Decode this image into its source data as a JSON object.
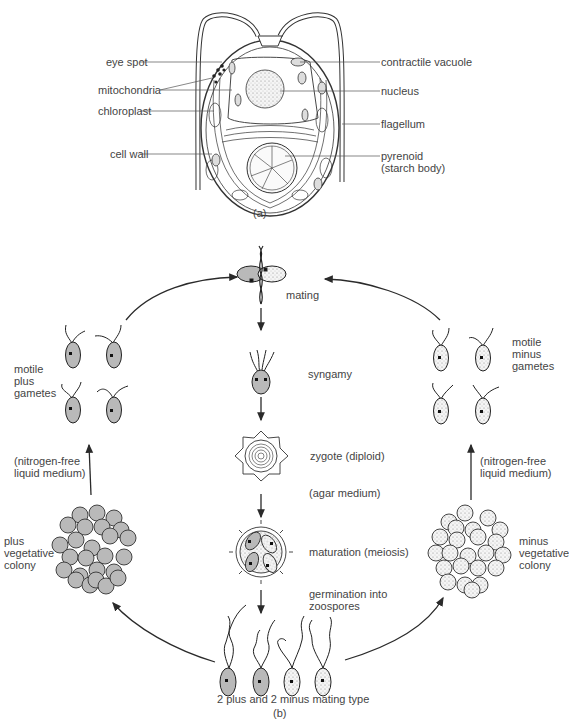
{
  "figure_a": {
    "caption": "(a)",
    "title": "Chlamydomonas cell structure",
    "labels_left": [
      {
        "id": "eye-spot",
        "text": "eye spot"
      },
      {
        "id": "mitochondria",
        "text": "mitochondria"
      },
      {
        "id": "chloroplast",
        "text": "chloroplast"
      },
      {
        "id": "cell-wall",
        "text": "cell wall"
      }
    ],
    "labels_right": [
      {
        "id": "contractile-vacuole",
        "text": "contractile vacuole"
      },
      {
        "id": "nucleus",
        "text": "nucleus"
      },
      {
        "id": "flagellum",
        "text": "flagellum"
      },
      {
        "id": "pyrenoid",
        "text": "pyrenoid\n(starch body)"
      }
    ]
  },
  "figure_b": {
    "caption": "(b)",
    "center_stages": [
      {
        "id": "mating",
        "text": "mating"
      },
      {
        "id": "syngamy",
        "text": "syngamy"
      },
      {
        "id": "zygote",
        "text": "zygote (diploid)"
      },
      {
        "id": "agar",
        "text": "(agar medium)"
      },
      {
        "id": "maturation",
        "text": "maturation (meiosis)"
      },
      {
        "id": "germination",
        "text": "germination into\nzoospores"
      },
      {
        "id": "zoospores",
        "text": "2 plus and 2 minus mating type"
      }
    ],
    "left_side": {
      "gametes": "motile\nplus\ngametes",
      "medium": "(nitrogen-free\nliquid medium)",
      "colony": "plus\nvegetative\ncolony"
    },
    "right_side": {
      "gametes": "motile\nminus\ngametes",
      "medium": "(nitrogen-free\nliquid medium)",
      "colony": "minus\nvegetative\ncolony"
    }
  },
  "colors": {
    "plus_fill": "#b9b9b9",
    "minus_fill": "#f2f2f2",
    "line": "#2a2a2a",
    "text": "#444444"
  }
}
